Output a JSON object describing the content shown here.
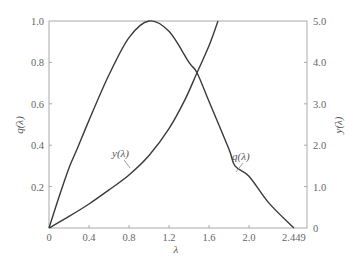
{
  "chart_data": {
    "type": "line",
    "title": "",
    "xlabel": "λ",
    "ylabel_left": "q(λ)",
    "ylabel_right": "y(λ)",
    "xlim": [
      0,
      2.6
    ],
    "ylim_left": [
      0,
      1.0
    ],
    "ylim_right": [
      0,
      5.0
    ],
    "x_ticks": [
      "0",
      "0.4",
      "0.8",
      "1.2",
      "1.6",
      "2.0",
      "2.449"
    ],
    "x_tick_values": [
      0,
      0.4,
      0.8,
      1.2,
      1.6,
      2.0,
      2.449
    ],
    "y_left_ticks": [
      "0.2",
      "0.4",
      "0.6",
      "0.8",
      "1.0"
    ],
    "y_left_tick_values": [
      0.2,
      0.4,
      0.6,
      0.8,
      1.0
    ],
    "y_right_ticks": [
      "0",
      "1.0",
      "2.0",
      "3.0",
      "4.0",
      "5.0"
    ],
    "y_right_tick_values": [
      0,
      1.0,
      2.0,
      3.0,
      4.0,
      5.0
    ],
    "origin_label": "0",
    "grid": false,
    "series": [
      {
        "name": "q(λ)",
        "axis": "left",
        "x": [
          0,
          0.1,
          0.2,
          0.28,
          0.4,
          0.6,
          0.8,
          1.0,
          1.2,
          1.4,
          1.48,
          1.61,
          1.8,
          1.86,
          2.0,
          2.2,
          2.449
        ],
        "y": [
          0,
          0.15,
          0.29,
          0.38,
          0.52,
          0.74,
          0.92,
          1.0,
          0.95,
          0.8,
          0.75,
          0.6,
          0.38,
          0.3,
          0.25,
          0.12,
          0
        ]
      },
      {
        "name": "y(λ)",
        "axis": "right",
        "x": [
          0,
          0.2,
          0.4,
          0.6,
          0.8,
          1.0,
          1.2,
          1.36,
          1.48,
          1.6,
          1.69
        ],
        "y": [
          0,
          0.28,
          0.58,
          0.92,
          1.28,
          1.75,
          2.4,
          3.1,
          3.75,
          4.4,
          5.0
        ]
      }
    ],
    "annotations": [
      {
        "text": "y(λ)",
        "points_to": "y(λ) curve near λ≈0.85"
      },
      {
        "text": "q(λ)",
        "points_to": "q(λ) curve near λ≈1.9"
      }
    ]
  },
  "labels": {
    "xlabel": "λ",
    "ylabel_left": "q(λ)",
    "ylabel_right": "y(λ)",
    "curve_y": "y(λ)",
    "curve_q": "q(λ)"
  },
  "colors": {
    "curve": "#3a3a3a",
    "frame": "#aaaaaa",
    "text": "#666666"
  }
}
